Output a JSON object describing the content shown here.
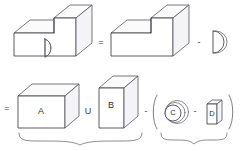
{
  "diagram": {
    "type": "constructive-solid-geometry",
    "stroke_color": "#3f3f46",
    "background_color": "#ffffff",
    "rows": [
      {
        "id": "row-1",
        "expression": "L-block with D-hole = step block - D-cylinder",
        "terms": [
          {
            "id": "result-solid",
            "kind": "solid",
            "shape": "stepped-block-with-d-hole",
            "label": ""
          },
          {
            "id": "step-block",
            "kind": "solid",
            "shape": "stepped-block",
            "label": ""
          },
          {
            "id": "d-cylinder",
            "kind": "solid",
            "shape": "d-shaped-cylinder",
            "label": ""
          }
        ],
        "operators": [
          {
            "id": "equals-1",
            "symbol": "="
          },
          {
            "id": "minus-1",
            "symbol": "-"
          }
        ]
      },
      {
        "id": "row-2",
        "expression": "= ( A U B ) - ( C - D )",
        "terms": [
          {
            "id": "box-a",
            "kind": "solid",
            "shape": "box",
            "label": "A"
          },
          {
            "id": "box-b",
            "kind": "solid",
            "shape": "tall-box",
            "label": "B"
          },
          {
            "id": "cylinder-c",
            "kind": "solid",
            "shape": "cylinder-end-view",
            "label": "C"
          },
          {
            "id": "slab-d",
            "kind": "solid",
            "shape": "thin-slab",
            "label": "D"
          }
        ],
        "operators": [
          {
            "id": "equals-2",
            "symbol": "="
          },
          {
            "id": "union-1",
            "symbol": "U"
          },
          {
            "id": "minus-2",
            "symbol": "-"
          },
          {
            "id": "minus-3",
            "symbol": "-"
          }
        ],
        "groups": [
          {
            "id": "group-union",
            "members": [
              "A",
              "B"
            ],
            "operator": "U"
          },
          {
            "id": "group-difference",
            "members": [
              "C",
              "D"
            ],
            "operator": "-"
          }
        ]
      }
    ],
    "braces": [
      {
        "id": "brace-union",
        "covers": "A U B"
      },
      {
        "id": "brace-difference",
        "covers": "C - D"
      }
    ],
    "operators": {
      "equals": "=",
      "minus": "-",
      "union": "U"
    },
    "labels": {
      "a": "A",
      "b": "B",
      "c": "C",
      "d": "D"
    }
  }
}
